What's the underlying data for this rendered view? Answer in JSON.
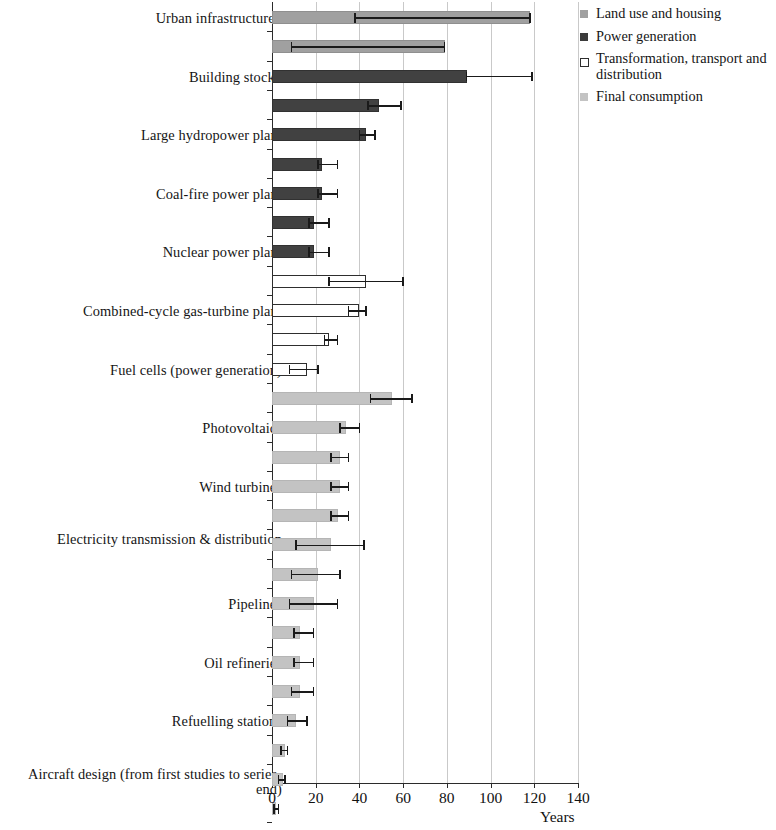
{
  "chart_data": {
    "type": "bar",
    "orientation": "horizontal",
    "title": "",
    "xlabel": "Years",
    "ylabel": "",
    "xlim": [
      0,
      140
    ],
    "xticks": [
      0,
      20,
      40,
      60,
      80,
      100,
      120,
      140
    ],
    "xticklabels": [
      "0",
      "20",
      "40",
      "60",
      "80",
      "100",
      "120",
      "140"
    ],
    "grid": "vertical",
    "legend_position": "top-right",
    "error_bars": "range (min-max)",
    "footnote_marker": "*",
    "legend": [
      {
        "label": "Land use and housing",
        "key": "land",
        "color": "#a0a0a0"
      },
      {
        "label": "Power generation",
        "key": "power",
        "color": "#3b3b3b"
      },
      {
        "label": "Transformation, transport and distribution",
        "key": "transform",
        "color": "#ffffff"
      },
      {
        "label": "Final consumption",
        "key": "final",
        "color": "#c3c3c3"
      }
    ],
    "categories": [
      "Urban infrastructure*",
      "Building stock*",
      "Large hydropower plant",
      "Coal-fire power plant",
      "Nuclear power plant",
      "Combined-cycle gas-turbine plant",
      "Fuel cells (power generation)",
      "Photovoltaics",
      "Wind turbines",
      "Electricity transmission & distribution",
      "Pipelines",
      "Oil refineries",
      "Refuelling stations",
      "Aircraft design (from first studies to series-end)",
      "Cement plant",
      "Aircraft (operating lifetime)",
      "Petrochemical plant",
      "Steel plant",
      "Manufacturing equipment",
      "Residential space heating and cooling",
      "Commercial heating and cooling equipment",
      "Passenger cars",
      "Household appliances (stoves, washers, etc.)",
      "Residential water heating equipment",
      "Consumer electronics",
      "Light bulbs (fluorescent)",
      "Office equipment",
      "Light bulbs (incandescent)"
    ],
    "values": [
      118,
      79,
      89,
      49,
      43,
      23,
      23,
      19,
      19,
      43,
      40,
      26,
      16,
      55,
      34,
      31,
      31,
      30,
      27,
      21,
      19,
      13,
      13,
      13,
      11,
      6,
      5,
      2
    ],
    "err_low": [
      38,
      9,
      89,
      44,
      40,
      21,
      21,
      17,
      17,
      26,
      35,
      24,
      8,
      45,
      31,
      27,
      27,
      27,
      11,
      9,
      8,
      10,
      10,
      9,
      7,
      4,
      3,
      1
    ],
    "err_high": [
      118,
      79,
      119,
      59,
      47,
      30,
      30,
      26,
      26,
      60,
      43,
      30,
      21,
      64,
      40,
      35,
      35,
      35,
      42,
      31,
      30,
      19,
      19,
      19,
      16,
      7,
      6,
      3
    ],
    "groups": [
      "land",
      "land",
      "power",
      "power",
      "power",
      "power",
      "power",
      "power",
      "power",
      "transform",
      "transform",
      "transform",
      "transform",
      "final",
      "final",
      "final",
      "final",
      "final",
      "final",
      "final",
      "final",
      "final",
      "final",
      "final",
      "final",
      "final",
      "final",
      "final"
    ]
  }
}
